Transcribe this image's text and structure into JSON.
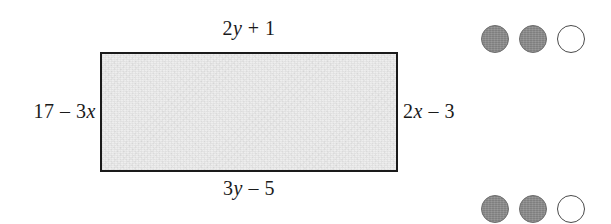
{
  "figure": {
    "type": "rectangle-with-labeled-sides",
    "shape_name": "rectangle",
    "fill_color": "#eeeeee",
    "border_color": "#1a1a1a",
    "labels": {
      "top": {
        "full": "2y + 1",
        "coefficient": "2",
        "variable": "y",
        "operator": "+",
        "constant": "1"
      },
      "bottom": {
        "full": "3y – 5",
        "coefficient": "3",
        "variable": "y",
        "operator": "–",
        "constant": "5"
      },
      "left": {
        "full": "17 – 3x",
        "constant": "17",
        "operator": "–",
        "coefficient": "3",
        "variable": "x"
      },
      "right": {
        "full": "2x – 3",
        "coefficient": "2",
        "variable": "x",
        "operator": "–",
        "constant": "3"
      }
    }
  },
  "indicators": {
    "fill_color": "#8b8b8b",
    "empty_color": "#ffffff",
    "groups": [
      {
        "name": "top-indicator-group",
        "dots": [
          {
            "state": "filled"
          },
          {
            "state": "filled"
          },
          {
            "state": "empty"
          }
        ]
      },
      {
        "name": "bottom-indicator-group",
        "dots": [
          {
            "state": "filled"
          },
          {
            "state": "filled"
          },
          {
            "state": "empty"
          }
        ]
      }
    ]
  }
}
